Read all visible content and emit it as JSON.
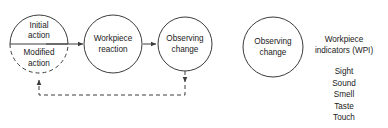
{
  "diagram": {
    "type": "process-flow-with-feedback",
    "left_process": {
      "nodes": [
        {
          "id": "action-node",
          "split": true,
          "top_label_line1": "Initial",
          "top_label_line2": "action",
          "bottom_label_line1": "Modified",
          "bottom_label_line2": "action",
          "top_style": "solid",
          "bottom_style": "dashed"
        },
        {
          "id": "workpiece-reaction-node",
          "label_line1": "Workpiece",
          "label_line2": "reaction",
          "style": "solid"
        },
        {
          "id": "observing-change-node",
          "label_line1": "Observing",
          "label_line2": "change",
          "style": "solid"
        }
      ],
      "connectors": [
        {
          "id": "arrow-action-to-reaction",
          "style": "solid",
          "direction": "right"
        },
        {
          "id": "arrow-reaction-to-observing",
          "style": "solid",
          "direction": "right"
        },
        {
          "id": "feedback-loop",
          "style": "dashed",
          "direction": "right-to-left"
        }
      ]
    },
    "right_legend": {
      "node": {
        "id": "observing-change-node-legend",
        "label_line1": "Observing",
        "label_line2": "change",
        "style": "solid"
      },
      "heading_line1": "Workpiece",
      "heading_line2": "indicators (WPI)",
      "items": [
        "Sight",
        "Sound",
        "Smell",
        "Taste",
        "Touch"
      ]
    },
    "colors": {
      "stroke": "#3c3c3c",
      "text": "#1a1a1a",
      "background": "#ffffff"
    }
  }
}
